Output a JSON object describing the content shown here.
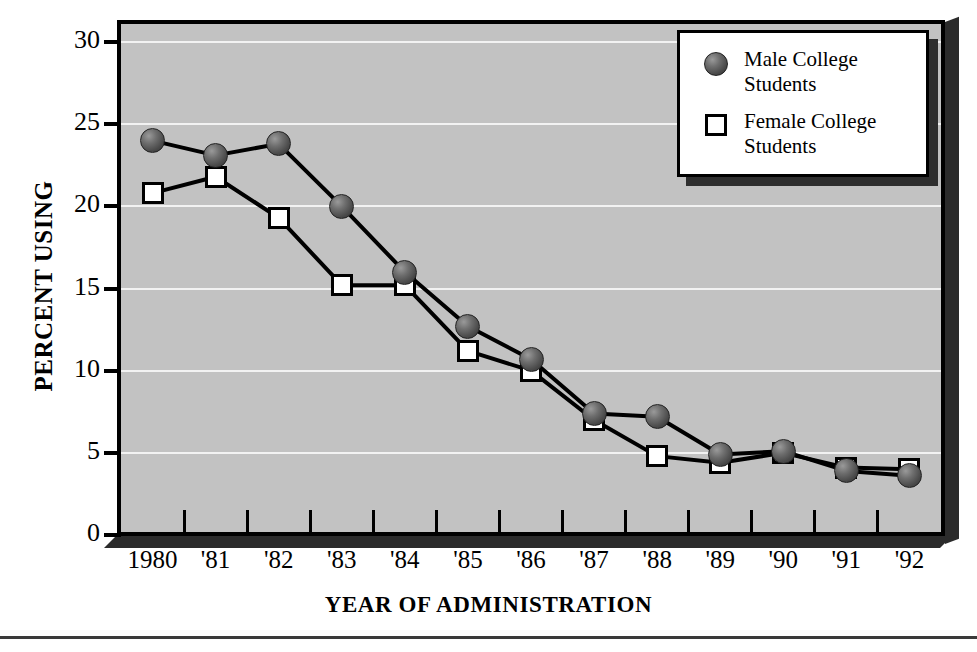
{
  "chart_data": {
    "type": "line",
    "title": "",
    "subtitle": "",
    "xlabel": "YEAR OF ADMINISTRATION",
    "ylabel": "PERCENT USING",
    "categories": [
      "1980",
      "'81",
      "'82",
      "'83",
      "'84",
      "'85",
      "'86",
      "'87",
      "'88",
      "'89",
      "'90",
      "'91",
      "'92"
    ],
    "x": [
      1980,
      1981,
      1982,
      1983,
      1984,
      1985,
      1986,
      1987,
      1988,
      1989,
      1990,
      1991,
      1992
    ],
    "ylim": [
      0,
      30
    ],
    "yticks": [
      0,
      5,
      10,
      15,
      20,
      25,
      30
    ],
    "ytick_labels": [
      "0",
      "5",
      "10",
      "15",
      "20",
      "25",
      "30"
    ],
    "grid": true,
    "grid_axis": "y",
    "legend_position": "top-right",
    "series": [
      {
        "name": "Male College Students",
        "marker": "circle",
        "values": [
          24.0,
          23.1,
          23.8,
          20.0,
          16.0,
          12.7,
          10.7,
          7.4,
          7.2,
          4.9,
          5.1,
          3.9,
          3.6
        ]
      },
      {
        "name": "Female College Students",
        "marker": "square",
        "values": [
          20.8,
          21.8,
          19.3,
          15.2,
          15.2,
          11.2,
          10.0,
          7.0,
          4.8,
          4.4,
          5.0,
          4.1,
          4.0
        ]
      }
    ]
  },
  "legend": {
    "items": [
      {
        "label": "Male College\nStudents",
        "marker": "circle"
      },
      {
        "label": "Female College\nStudents",
        "marker": "square"
      }
    ]
  },
  "colors": {
    "plot_background": "#c2c2c2",
    "gridline": "#f2f2f2",
    "axis": "#000000",
    "marker_male": "#5a5a5a",
    "marker_female": "#ffffff",
    "shadow": "#2e2e2e",
    "page_background": "#ffffff"
  }
}
